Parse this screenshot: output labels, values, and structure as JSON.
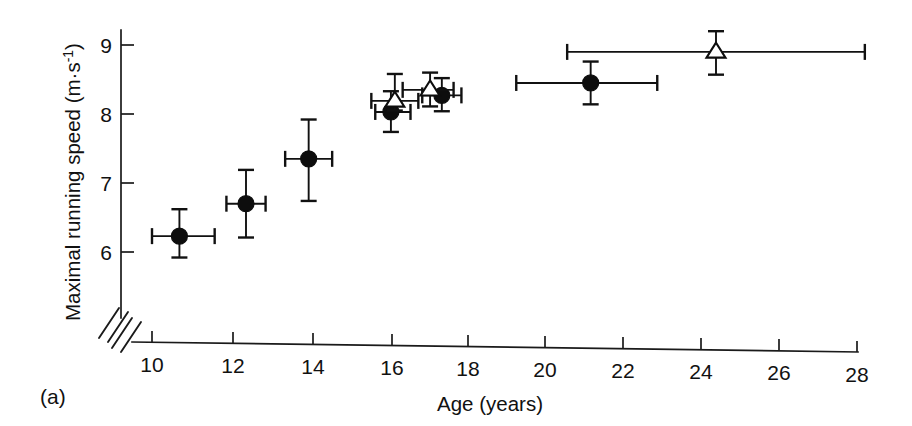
{
  "figure": {
    "panel_label": "(a)",
    "background_color": "#ffffff",
    "ink_color": "#111111"
  },
  "axes": {
    "y": {
      "title": "Maximal running speed (m·s",
      "title_exponent": "-1",
      "title_close": ")",
      "title_full": "Maximal running speed (m·s⁻¹)",
      "ticks": [
        "6",
        "7",
        "8",
        "9"
      ]
    },
    "x": {
      "title": "Age (years)",
      "ticks": [
        "10",
        "12",
        "14",
        "16",
        "18",
        "20",
        "22",
        "24",
        "26",
        "28"
      ],
      "has_axis_break": true
    }
  },
  "chart_data": {
    "type": "scatter",
    "title": "",
    "xlabel": "Age (years)",
    "ylabel": "Maximal running speed (m·s⁻¹)",
    "xlim": [
      9.4,
      28.4
    ],
    "ylim": [
      5.55,
      9.25
    ],
    "xticks": [
      10,
      12,
      14,
      16,
      18,
      20,
      22,
      24,
      26,
      28
    ],
    "yticks": [
      6,
      7,
      8,
      9
    ],
    "grid": false,
    "legend": "none",
    "axis_break": {
      "axis": "both",
      "note": "diagonal double-slash break at origin corner"
    },
    "series": [
      {
        "name": "filled-circle",
        "marker": "filled circle",
        "points": [
          {
            "x": 10.7,
            "y": 6.23,
            "xerr_low": 10.0,
            "xerr_high": 11.6,
            "yerr_low": 5.92,
            "yerr_high": 6.62
          },
          {
            "x": 12.4,
            "y": 6.7,
            "xerr_low": 11.9,
            "xerr_high": 12.9,
            "yerr_low": 6.21,
            "yerr_high": 7.19
          },
          {
            "x": 14.0,
            "y": 7.35,
            "xerr_low": 13.4,
            "xerr_high": 14.6,
            "yerr_low": 6.74,
            "yerr_high": 7.92
          },
          {
            "x": 16.1,
            "y": 8.03,
            "xerr_low": 15.7,
            "xerr_high": 16.6,
            "yerr_low": 7.74,
            "yerr_high": 8.33
          },
          {
            "x": 17.4,
            "y": 8.27,
            "xerr_low": 16.9,
            "xerr_high": 17.9,
            "yerr_low": 8.04,
            "yerr_high": 8.52
          },
          {
            "x": 21.2,
            "y": 8.45,
            "xerr_low": 19.3,
            "xerr_high": 22.9,
            "yerr_low": 8.14,
            "yerr_high": 8.76
          }
        ]
      },
      {
        "name": "open-triangle",
        "marker": "open triangle",
        "points": [
          {
            "x": 16.2,
            "y": 8.19,
            "xerr_low": 15.6,
            "xerr_high": 16.8,
            "yerr_low": 8.05,
            "yerr_high": 8.58
          },
          {
            "x": 17.1,
            "y": 8.35,
            "xerr_low": 16.4,
            "xerr_high": 17.7,
            "yerr_low": 8.11,
            "yerr_high": 8.6
          },
          {
            "x": 24.4,
            "y": 8.9,
            "xerr_low": 20.6,
            "xerr_high": 28.2,
            "yerr_low": 8.57,
            "yerr_high": 9.2
          }
        ]
      }
    ]
  }
}
